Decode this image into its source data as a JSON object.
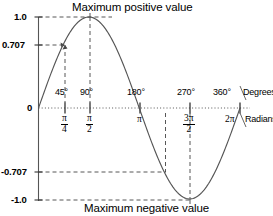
{
  "figure": {
    "title_top": "Maximum positive value",
    "title_bottom": "Maximum negative value",
    "axis_unit_degrees": "Degrees",
    "axis_unit_radians": "Radians",
    "stroke_color": "#555555",
    "text_color": "#000000",
    "background": "#ffffff"
  },
  "y_axis": {
    "labels": [
      "1.0",
      "0.707",
      "0",
      "-0.707",
      "-1.0"
    ],
    "values": [
      1.0,
      0.707,
      0,
      -0.707,
      -1.0
    ]
  },
  "x_axis": {
    "degree_labels": [
      "45°",
      "90°",
      "180°",
      "270°",
      "360°"
    ],
    "degree_values": [
      45,
      90,
      180,
      270,
      360
    ],
    "radian_labels": [
      {
        "num": "π",
        "den": "4"
      },
      {
        "num": "π",
        "den": "2"
      },
      {
        "plain": "π"
      },
      {
        "num": "3π",
        "den": "2"
      },
      {
        "plain": "2π"
      }
    ]
  },
  "chart_data": {
    "type": "line",
    "title": "Maximum positive value",
    "subtitle": "Maximum negative value",
    "xlabel": "Degrees / Radians",
    "ylabel": "",
    "xlim": [
      0,
      360
    ],
    "ylim": [
      -1.0,
      1.0
    ],
    "grid": false,
    "legend": "none",
    "series": [
      {
        "name": "sine",
        "x": [
          0,
          15,
          30,
          45,
          60,
          75,
          90,
          105,
          120,
          135,
          150,
          165,
          180,
          195,
          210,
          225,
          240,
          255,
          270,
          285,
          300,
          315,
          330,
          345,
          360
        ],
        "y": [
          0,
          0.259,
          0.5,
          0.707,
          0.866,
          0.966,
          1.0,
          0.966,
          0.866,
          0.707,
          0.5,
          0.259,
          0,
          -0.259,
          -0.5,
          -0.707,
          -0.866,
          -0.966,
          -1.0,
          -0.966,
          -0.866,
          -0.707,
          -0.5,
          -0.259,
          0
        ]
      }
    ],
    "annotations": [
      {
        "text": "Maximum positive value",
        "at_x": 90,
        "at_y": 1.0
      },
      {
        "text": "Maximum negative value",
        "at_x": 270,
        "at_y": -1.0
      }
    ],
    "guide_lines": [
      {
        "type": "horizontal",
        "y": 1.0,
        "from_x": 0,
        "to_x": 90
      },
      {
        "type": "horizontal",
        "y": 0.707,
        "from_x": 0,
        "to_x": 45
      },
      {
        "type": "horizontal",
        "y": -0.707,
        "from_x": 0,
        "to_x": 225
      },
      {
        "type": "horizontal",
        "y": -1.0,
        "from_x": 0,
        "to_x": 270
      },
      {
        "type": "vertical",
        "x": 45,
        "from_y": 0,
        "to_y": 0.707
      },
      {
        "type": "vertical",
        "x": 90,
        "from_y": 0,
        "to_y": 1.0
      },
      {
        "type": "vertical",
        "x": 225,
        "from_y": 0,
        "to_y": -0.707
      },
      {
        "type": "vertical",
        "x": 270,
        "from_y": 0,
        "to_y": -1.0
      }
    ]
  }
}
